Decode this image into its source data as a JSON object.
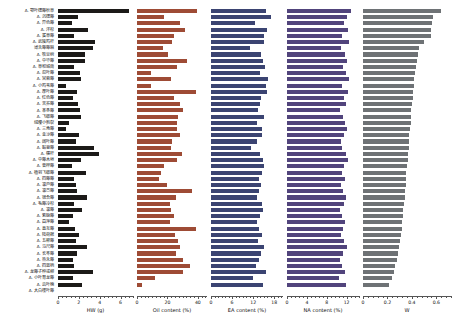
{
  "chart_data": {
    "type": "bar",
    "orientation": "horizontal",
    "title": "",
    "grid": false,
    "legend": null,
    "categories": [
      "A. 鄂叶楤藤秋草",
      "A. 沉楤藤",
      "A. 异色藤",
      "A. 洋杉",
      "A. 蜜草藤",
      "A. 武陵鸡杆",
      "薄舌藤藤麻",
      "A. 牧豆树",
      "A. 中华藤",
      "A. 草和城南",
      "A. 忍叶藤",
      "A. 宫蓉藤",
      "A. 小鸡苇藤",
      "A. 厚叶藤",
      "A. 红色藤",
      "A. 苦荞藤",
      "A. 革条藤",
      "A. 飞蛾藤",
      "绒缨小剪裂",
      "A. 三角藤",
      "A. 金沙藤",
      "A. 阔叶藤",
      "A. 黏菊藤",
      "A. 櫶杆",
      "A. 中藤木垣",
      "A. 菅桦藤",
      "A. 植羽飞蛾藤",
      "A. 四藤藤",
      "A. 凛芦藤",
      "A. 凛苎藤",
      "A. 锦合藤",
      "A. 毛藤冷杉",
      "A. 凛藤",
      "A. 紫脉藤",
      "A. 菖萍藤",
      "A. 直互藤",
      "A. 陆荷棉",
      "A. 五彬藤",
      "A. 马尺藤",
      "A. 长苓藤",
      "A. 热禾藤",
      "A. 四篮柄",
      "A. 龙藤子种或柳",
      "A. 小叶育龙藤",
      "A. 齿叶楠",
      "A. 大白楼叶藤"
    ],
    "panels": [
      {
        "key": "hw",
        "xlabel": "HW (g)",
        "xlim": [
          0,
          7.2
        ],
        "ticks": [
          0,
          2,
          4,
          6
        ],
        "tick_labels": [
          "0",
          "2",
          "4",
          "6"
        ],
        "minor_step": 0.4,
        "color": "#1c1a18",
        "values": [
          6.85,
          1.95,
          1.35,
          2.85,
          1.5,
          3.55,
          3.35,
          2.6,
          2.55,
          1.55,
          2.1,
          2.2,
          0.8,
          1.85,
          1.45,
          1.95,
          2.15,
          2.25,
          1.1,
          0.75,
          2.05,
          1.75,
          3.45,
          3.95,
          2.25,
          1.3,
          2.65,
          1.55,
          1.75,
          1.8,
          2.8,
          1.55,
          2.35,
          1.45,
          1.1,
          1.65,
          2.0,
          1.7,
          2.75,
          1.8,
          1.45,
          1.5,
          3.4,
          1.45,
          2.3
        ]
      },
      {
        "key": "oil",
        "xlabel": "Oil content (%)",
        "xlim": [
          0,
          46
        ],
        "ticks": [
          0,
          20,
          40
        ],
        "tick_labels": [
          "0",
          "20",
          "40"
        ],
        "minor_step": 2.5,
        "color": "#9e4b35",
        "values": [
          39.5,
          17.5,
          28.0,
          31.5,
          24.0,
          23.0,
          17.0,
          20.5,
          33.0,
          26.5,
          9.5,
          22.5,
          9.0,
          39.0,
          24.5,
          28.5,
          30.5,
          27.0,
          26.5,
          26.0,
          28.0,
          23.0,
          22.5,
          29.5,
          26.5,
          18.0,
          15.5,
          14.5,
          19.5,
          36.0,
          25.5,
          21.5,
          22.5,
          24.5,
          21.5,
          38.5,
          25.0,
          27.0,
          28.0,
          25.5,
          30.0,
          35.0,
          30.0,
          12.0,
          3.0
        ]
      },
      {
        "key": "ea",
        "xlabel": "EA content (%)",
        "xlim": [
          0,
          20.5
        ],
        "ticks": [
          0,
          6,
          12,
          18
        ],
        "tick_labels": [
          "0",
          "6",
          "12",
          "18"
        ],
        "minor_step": 1.0,
        "color": "#3b4472",
        "values": [
          15.6,
          17.2,
          12.5,
          16.0,
          15.0,
          15.2,
          11.2,
          14.2,
          14.8,
          15.4,
          14.0,
          16.2,
          15.8,
          16.0,
          14.2,
          14.0,
          13.4,
          15.0,
          13.0,
          14.6,
          14.4,
          13.2,
          11.5,
          14.0,
          14.8,
          15.2,
          14.6,
          13.8,
          14.2,
          13.6,
          13.0,
          14.4,
          14.8,
          14.0,
          13.2,
          13.8,
          14.6,
          13.4,
          15.0,
          14.2,
          13.6,
          12.8,
          15.6,
          12.0,
          14.8
        ]
      },
      {
        "key": "na",
        "xlabel": "NA content (%)",
        "xlim": [
          0,
          14.5
        ],
        "ticks": [
          0,
          4,
          8,
          12
        ],
        "tick_labels": [
          "0",
          "4",
          "8",
          "12"
        ],
        "minor_step": 0.8,
        "color": "#51447c",
        "values": [
          12.8,
          12.0,
          11.5,
          12.2,
          11.0,
          12.5,
          10.8,
          11.6,
          12.0,
          11.2,
          11.8,
          12.4,
          11.0,
          12.2,
          11.4,
          11.8,
          10.6,
          11.2,
          11.6,
          12.0,
          11.4,
          10.8,
          11.0,
          11.8,
          12.2,
          11.4,
          11.0,
          11.6,
          10.8,
          11.2,
          11.8,
          11.4,
          10.6,
          11.0,
          11.6,
          11.2,
          10.8,
          11.4,
          12.0,
          11.2,
          10.6,
          11.0,
          11.6,
          10.4,
          11.8
        ]
      },
      {
        "key": "w",
        "xlabel": "W",
        "xlim": [
          0,
          0.72
        ],
        "ticks": [
          0,
          0.2,
          0.4,
          0.6
        ],
        "tick_labels": [
          "0",
          "0.2",
          "0.4",
          "0.6"
        ],
        "minor_step": 0.04,
        "color": "#6e7275",
        "values": [
          0.64,
          0.575,
          0.565,
          0.56,
          0.56,
          0.495,
          0.46,
          0.45,
          0.44,
          0.43,
          0.425,
          0.42,
          0.415,
          0.41,
          0.405,
          0.4,
          0.395,
          0.395,
          0.39,
          0.385,
          0.38,
          0.375,
          0.375,
          0.37,
          0.365,
          0.36,
          0.355,
          0.35,
          0.35,
          0.345,
          0.34,
          0.335,
          0.33,
          0.325,
          0.32,
          0.315,
          0.31,
          0.3,
          0.295,
          0.285,
          0.275,
          0.26,
          0.255,
          0.235,
          0.215
        ]
      }
    ]
  }
}
